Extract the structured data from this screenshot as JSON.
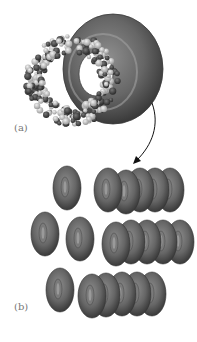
{
  "figure": {
    "panel_a": {
      "label": "(a)",
      "description": "Space-filling molecular model of a ring-shaped molecule beside a smooth torus representation"
    },
    "panel_b": {
      "label": "(b)",
      "description": "Packing of toroidal units into stacked columns"
    },
    "colors": {
      "torus_fill": "#6e6e6e",
      "torus_dark": "#3a3a3a",
      "torus_light": "#9a9a9a",
      "atom_light": "#d8d8d8",
      "atom_dark": "#4a4a4a",
      "arrow": "#111111",
      "label": "#777777"
    }
  }
}
